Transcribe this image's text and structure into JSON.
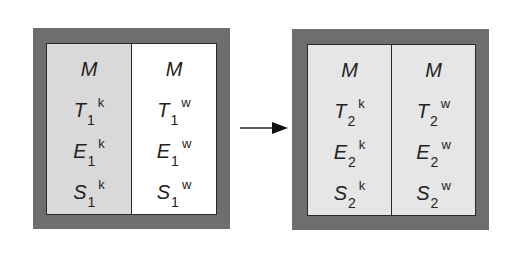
{
  "diagram": {
    "left_box": {
      "state_index": "1",
      "columns": [
        {
          "id": "k",
          "fill": "#d9d9d9",
          "rows": [
            {
              "var": "M",
              "sub": "",
              "sup": ""
            },
            {
              "var": "T",
              "sub": "1",
              "sup": "k"
            },
            {
              "var": "E",
              "sub": "1",
              "sup": "k"
            },
            {
              "var": "S",
              "sub": "1",
              "sup": "k"
            }
          ]
        },
        {
          "id": "w",
          "fill": "#ffffff",
          "rows": [
            {
              "var": "M",
              "sub": "",
              "sup": ""
            },
            {
              "var": "T",
              "sub": "1",
              "sup": "w"
            },
            {
              "var": "E",
              "sub": "1",
              "sup": "w"
            },
            {
              "var": "S",
              "sub": "1",
              "sup": "w"
            }
          ]
        }
      ]
    },
    "arrow": {
      "direction": "right",
      "icon": "arrow-right-icon"
    },
    "right_box": {
      "state_index": "2",
      "columns": [
        {
          "id": "k",
          "fill": "#e6e6e6",
          "rows": [
            {
              "var": "M",
              "sub": "",
              "sup": ""
            },
            {
              "var": "T",
              "sub": "2",
              "sup": "k"
            },
            {
              "var": "E",
              "sub": "2",
              "sup": "k"
            },
            {
              "var": "S",
              "sub": "2",
              "sup": "k"
            }
          ]
        },
        {
          "id": "w",
          "fill": "#e6e6e6",
          "rows": [
            {
              "var": "M",
              "sub": "",
              "sup": ""
            },
            {
              "var": "T",
              "sub": "2",
              "sup": "w"
            },
            {
              "var": "E",
              "sub": "2",
              "sup": "w"
            },
            {
              "var": "S",
              "sub": "2",
              "sup": "w"
            }
          ]
        }
      ]
    },
    "colors": {
      "frame": "#6e6e6e",
      "border": "#2a2a2a",
      "text": "#222222"
    }
  }
}
